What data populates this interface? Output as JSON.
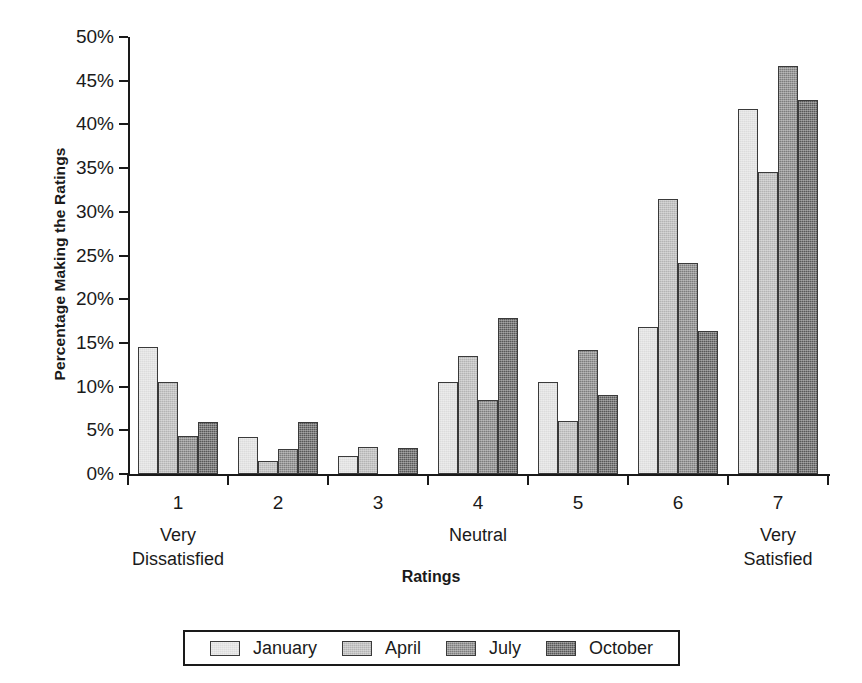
{
  "chart_data": {
    "type": "bar",
    "title": "",
    "xlabel": "Ratings",
    "ylabel": "Percentage Making the Ratings",
    "ylim": [
      0,
      50
    ],
    "ytick_values": [
      0,
      5,
      10,
      15,
      20,
      25,
      30,
      35,
      40,
      45,
      50
    ],
    "ytick_labels": [
      "0%",
      "5%",
      "10%",
      "15%",
      "20%",
      "25%",
      "30%",
      "35%",
      "40%",
      "45%",
      "50%"
    ],
    "grid": false,
    "legend_position": "bottom",
    "categories": [
      "1",
      "2",
      "3",
      "4",
      "5",
      "6",
      "7"
    ],
    "category_sublabels": [
      "Very\nDissatisfied",
      "",
      "",
      "Neutral",
      "",
      "",
      "Very\nSatisfied"
    ],
    "category_sublabel_lines": [
      [
        "Very",
        "Dissatisfied"
      ],
      [],
      [],
      [
        "Neutral"
      ],
      [],
      [],
      [
        "Very",
        "Satisfied"
      ]
    ],
    "series": [
      {
        "name": "January",
        "color": "#dcdcdc",
        "values": [
          14.5,
          4.2,
          2.1,
          10.5,
          10.5,
          16.8,
          41.8
        ]
      },
      {
        "name": "April",
        "color": "#b4b4b4",
        "values": [
          10.5,
          1.5,
          3.1,
          13.5,
          6.1,
          31.5,
          34.6
        ]
      },
      {
        "name": "July",
        "color": "#7d7d7d",
        "values": [
          4.3,
          2.9,
          0.0,
          8.5,
          14.2,
          24.2,
          46.7
        ]
      },
      {
        "name": "October",
        "color": "#585858",
        "values": [
          6.0,
          6.0,
          3.0,
          17.8,
          9.0,
          16.4,
          42.8
        ]
      }
    ]
  },
  "legend": {
    "entries": [
      "January",
      "April",
      "July",
      "October"
    ]
  }
}
